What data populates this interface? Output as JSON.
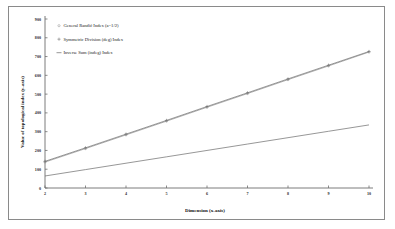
{
  "chart_data": {
    "type": "line",
    "title": "",
    "xlabel": "Dimension (x-axis)",
    "ylabel": "Value of topological index (y-axis)",
    "x": [
      2,
      3,
      4,
      5,
      6,
      7,
      8,
      9,
      10
    ],
    "xlim": [
      2,
      10
    ],
    "ylim": [
      0,
      900
    ],
    "xticks": [
      "2",
      "3",
      "4",
      "5",
      "6",
      "7",
      "8",
      "9",
      "10"
    ],
    "yticks": [
      "0",
      "100",
      "200",
      "300",
      "400",
      "500",
      "600",
      "700",
      "800",
      "900"
    ],
    "grid": false,
    "legend_position": "upper-left-inside",
    "series": [
      {
        "name": "General Randic Index (a=1/2)",
        "label": "General Randić Index (a=1/2)",
        "marker": "dot",
        "color": "#8c8c8c",
        "values": [
          138,
          210,
          283,
          356,
          430,
          503,
          577,
          650,
          724
        ]
      },
      {
        "name": "Symmetric Division (deg) Index",
        "label": "Symmetric Division (deg) Index",
        "marker": "plus",
        "color": "#707070",
        "values": [
          142,
          214,
          287,
          360,
          434,
          507,
          581,
          654,
          727
        ]
      },
      {
        "name": "Inverse Sum (indeg) Index",
        "label": "Inverse Sum (indeg) Index",
        "marker": "line",
        "color": "#6a6a6a",
        "values": [
          64,
          98,
          132,
          166,
          200,
          234,
          268,
          302,
          336
        ]
      }
    ]
  },
  "legend": {
    "items": [
      {
        "label": "General Randić Index (a=1/2)",
        "marker": "dot"
      },
      {
        "label": "Symmetric Division (deg) Index",
        "marker": "plus"
      },
      {
        "label": "Inverse Sum (indeg) Index",
        "marker": "line"
      }
    ]
  },
  "axes": {
    "x_title": "Dimension (x-axis)",
    "y_title": "Value of topological index (y-axis)"
  },
  "colors": {
    "frame": "#8a8a8a",
    "axis": "#6e6e6e",
    "background": "#ffffff"
  }
}
